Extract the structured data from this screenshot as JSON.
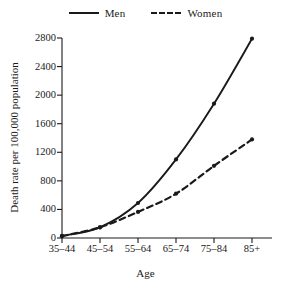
{
  "chart_data": {
    "type": "line",
    "title": "",
    "xlabel": "Age",
    "ylabel": "Death rate per 100,000 population",
    "categories": [
      "35–44",
      "45–54",
      "55–64",
      "65–74",
      "75–84",
      "85+"
    ],
    "series": [
      {
        "name": "Men",
        "style": "solid",
        "color": "#1a1a1a",
        "values": [
          30,
          150,
          490,
          1100,
          1880,
          2790
        ]
      },
      {
        "name": "Women",
        "style": "dashed",
        "color": "#1a1a1a",
        "values": [
          25,
          150,
          365,
          620,
          1010,
          1380
        ]
      }
    ],
    "ylim": [
      0,
      2800
    ],
    "yticks": [
      0,
      400,
      800,
      1200,
      1600,
      2000,
      2400,
      2800
    ],
    "ytick_labels": [
      "0",
      "400",
      "800",
      "1200",
      "1600",
      "2000",
      "2400",
      "2800"
    ],
    "grid": false,
    "legend_position": "top-center"
  },
  "legend": {
    "entries": [
      {
        "label": "Men"
      },
      {
        "label": "Women"
      }
    ]
  },
  "axes": {
    "y_title": "Death rate per 100,000 population",
    "x_title": "Age"
  }
}
